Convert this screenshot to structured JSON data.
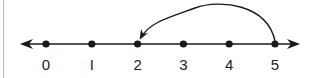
{
  "diagram": {
    "type": "number-line",
    "ticks": [
      {
        "value": 0,
        "label": "0"
      },
      {
        "value": 1,
        "label": "I"
      },
      {
        "value": 2,
        "label": "2"
      },
      {
        "value": 3,
        "label": "3"
      },
      {
        "value": 4,
        "label": "4"
      },
      {
        "value": 5,
        "label": "5"
      }
    ],
    "jump": {
      "from": 5,
      "to": 2,
      "direction": "left"
    },
    "arrows": {
      "left": true,
      "right": true
    },
    "colors": {
      "ink": "#1a1a1a",
      "frame": "#b8b8b8"
    }
  }
}
